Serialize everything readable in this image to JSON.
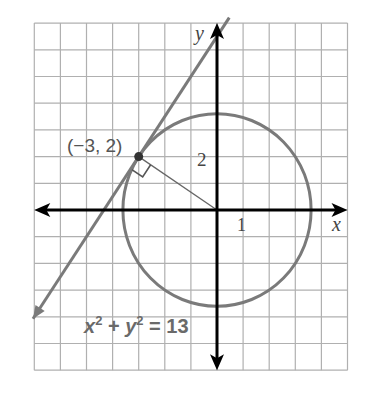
{
  "figure": {
    "grid": {
      "x_min": -7,
      "x_max": 5,
      "y_min": -6,
      "y_max": 7,
      "step": 1
    },
    "axes": {
      "x_label": "x",
      "y_label": "y",
      "x_tick_label": "1",
      "y_tick_label": "2"
    },
    "circle": {
      "equation_label_parts": [
        "x",
        "2",
        " + ",
        "y",
        "2",
        " = 13"
      ],
      "radius_squared": 13,
      "center": [
        0,
        0
      ]
    },
    "point": {
      "label": "(−3, 2)",
      "x": -3,
      "y": 2
    },
    "tangent_line": {
      "slope": 1.5,
      "intercept": 6.5
    },
    "radius_segment": {
      "from": [
        0,
        0
      ],
      "to": [
        -3,
        2
      ]
    },
    "right_angle_marker": true,
    "colors": {
      "grid": "#b0b0b0",
      "axes": "#000000",
      "curve": "#7a7a7a",
      "label": "#555555"
    }
  }
}
